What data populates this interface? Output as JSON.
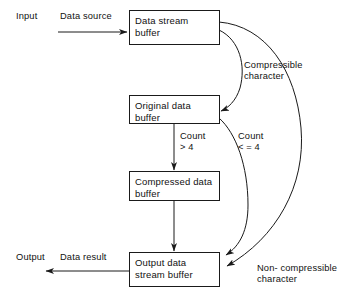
{
  "diagram": {
    "stroke_color": "#1a1a1a",
    "background_color": "#ffffff",
    "nodes": [
      {
        "id": "data-stream-buffer",
        "label": "Data stream\nbuffer"
      },
      {
        "id": "original-data-buffer",
        "label": "Original data\nbuffer"
      },
      {
        "id": "compressed-data-buffer",
        "label": "Compressed data\nbuffer"
      },
      {
        "id": "output-data-stream-buffer",
        "label": "Output data\nstream buffer"
      }
    ],
    "io_labels": [
      {
        "id": "input",
        "text": "Input"
      },
      {
        "id": "data-source",
        "text": "Data source"
      },
      {
        "id": "output",
        "text": "Output"
      },
      {
        "id": "data-result",
        "text": "Data result"
      }
    ],
    "edge_labels": [
      {
        "id": "compressible-character",
        "text": "Compressible\ncharacter"
      },
      {
        "id": "count-greater-than-4",
        "text": "Count\n> 4"
      },
      {
        "id": "count-less-equal-4",
        "text": "Count\n< = 4"
      },
      {
        "id": "non-compressible-character",
        "text": "Non- compressible\ncharacter"
      }
    ]
  }
}
